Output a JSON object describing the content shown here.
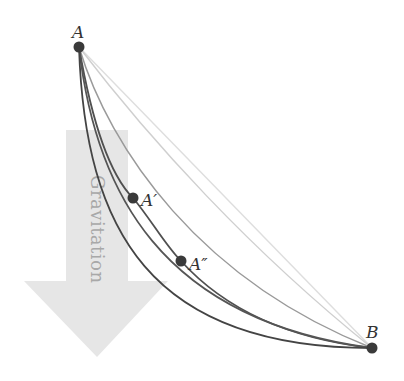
{
  "diagram": {
    "arrow": {
      "label": "Gravitation",
      "fill": "#e6e6e6"
    },
    "points": {
      "A": {
        "label": "A",
        "x": 79,
        "y": 47
      },
      "A_prime": {
        "label": "A′",
        "x": 133,
        "y": 198
      },
      "A_double_prime": {
        "label": "A″",
        "x": 181,
        "y": 261
      },
      "B": {
        "label": "B",
        "x": 372,
        "y": 348
      }
    },
    "colors": {
      "dark_curve": "#4a4a4a",
      "light_curve": "#c8c8c8",
      "straight_line": "#dedede",
      "point_fill": "#3a3a3a"
    },
    "curves": [
      {
        "name": "straight-line",
        "style": "light"
      },
      {
        "name": "light-arc",
        "style": "light"
      },
      {
        "name": "mid-arc",
        "style": "medium"
      },
      {
        "name": "dark-curve-1",
        "style": "dark"
      },
      {
        "name": "dark-curve-2",
        "style": "dark"
      },
      {
        "name": "cycloid",
        "style": "dark"
      }
    ]
  }
}
